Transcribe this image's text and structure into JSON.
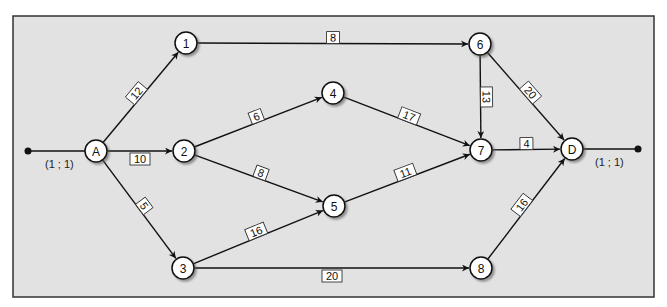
{
  "diagram": {
    "type": "network-graph",
    "background_color": "#e2e2e2",
    "frame_color": "#333333",
    "nodes": [
      {
        "id": "A",
        "label": "A",
        "x": 96,
        "y": 151
      },
      {
        "id": "1",
        "label": "1",
        "x": 186,
        "y": 43
      },
      {
        "id": "2",
        "label": "2",
        "x": 184,
        "y": 151
      },
      {
        "id": "3",
        "label": "3",
        "x": 183,
        "y": 268
      },
      {
        "id": "4",
        "label": "4",
        "x": 333,
        "y": 93
      },
      {
        "id": "5",
        "label": "5",
        "x": 334,
        "y": 206
      },
      {
        "id": "6",
        "label": "6",
        "x": 480,
        "y": 44
      },
      {
        "id": "7",
        "label": "7",
        "x": 481,
        "y": 150
      },
      {
        "id": "8",
        "label": "8",
        "x": 481,
        "y": 268
      },
      {
        "id": "D",
        "label": "D",
        "x": 572,
        "y": 149
      }
    ],
    "edges": [
      {
        "from": "A",
        "to": "1",
        "weight": "12"
      },
      {
        "from": "A",
        "to": "2",
        "weight": "10"
      },
      {
        "from": "A",
        "to": "3",
        "weight": "5"
      },
      {
        "from": "1",
        "to": "6",
        "weight": "8"
      },
      {
        "from": "2",
        "to": "4",
        "weight": "6"
      },
      {
        "from": "2",
        "to": "5",
        "weight": "8"
      },
      {
        "from": "3",
        "to": "5",
        "weight": "16"
      },
      {
        "from": "3",
        "to": "8",
        "weight": "20"
      },
      {
        "from": "4",
        "to": "7",
        "weight": "17"
      },
      {
        "from": "5",
        "to": "7",
        "weight": "11"
      },
      {
        "from": "6",
        "to": "7",
        "weight": "13"
      },
      {
        "from": "6",
        "to": "D",
        "weight": "20"
      },
      {
        "from": "7",
        "to": "D",
        "weight": "4"
      },
      {
        "from": "8",
        "to": "D",
        "weight": "16"
      }
    ],
    "source_terminal": {
      "x": 28,
      "y": 151,
      "label": "(1 ; 1)"
    },
    "sink_terminal": {
      "x": 638,
      "y": 149,
      "label": "(1 ; 1)"
    }
  }
}
